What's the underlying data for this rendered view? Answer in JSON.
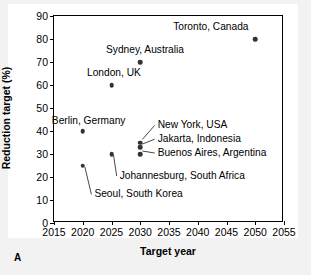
{
  "panel": {
    "label": "A"
  },
  "chart_data": {
    "type": "scatter",
    "title": "",
    "xlabel": "Target year",
    "ylabel": "Reduction target (%)",
    "xlim": [
      2015,
      2055
    ],
    "ylim": [
      0,
      90
    ],
    "xticks": [
      2015,
      2020,
      2025,
      2030,
      2035,
      2040,
      2045,
      2050,
      2055
    ],
    "yticks": [
      0,
      10,
      20,
      30,
      40,
      50,
      60,
      70,
      80,
      90
    ],
    "grid": false,
    "legend": false,
    "points": [
      {
        "label": "Toronto, Canada",
        "x": 2050,
        "y": 80,
        "label_anchor": "end",
        "label_x": 2049,
        "label_y": 85,
        "leader": false
      },
      {
        "label": "Sydney, Australia",
        "x": 2030,
        "y": 70,
        "label_anchor": "middle",
        "label_x": 2031,
        "label_y": 75,
        "leader": false
      },
      {
        "label": "London, UK",
        "x": 2025,
        "y": 60,
        "label_anchor": "middle",
        "label_x": 2025.6,
        "label_y": 65,
        "leader": false
      },
      {
        "label": "Berlin, Germany",
        "x": 2020,
        "y": 40,
        "label_anchor": "middle",
        "label_x": 2021.2,
        "label_y": 44,
        "leader": false
      },
      {
        "label": "New York, USA",
        "x": 2030,
        "y": 35,
        "label_anchor": "start",
        "label_x": 2033.2,
        "label_y": 42,
        "leader": true
      },
      {
        "label": "Jakarta, Indonesia",
        "x": 2030,
        "y": 33,
        "label_anchor": "start",
        "label_x": 2033.2,
        "label_y": 36,
        "leader": true
      },
      {
        "label": "Buenos Aires, Argentina",
        "x": 2030,
        "y": 30,
        "label_anchor": "start",
        "label_x": 2033.2,
        "label_y": 30,
        "leader": true
      },
      {
        "label": "Johannesburg, South Africa",
        "x": 2025,
        "y": 30,
        "label_anchor": "start",
        "label_x": 2026.6,
        "label_y": 20,
        "leader": true
      },
      {
        "label": "Seoul, South Korea",
        "x": 2020,
        "y": 25,
        "label_anchor": "start",
        "label_x": 2022.2,
        "label_y": 12,
        "leader": true
      }
    ]
  }
}
